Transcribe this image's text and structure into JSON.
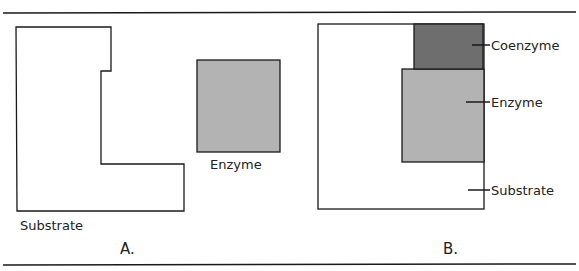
{
  "colors": {
    "line": "#1a1a1a",
    "enzyme_fill": "#b3b3b3",
    "coenzyme_fill": "#6e6e6e",
    "substrate_fill": "#ffffff"
  },
  "panel_a": {
    "caption": "A.",
    "substrate_label": "Substrate",
    "enzyme_label": "Enzyme"
  },
  "panel_b": {
    "caption": "B.",
    "coenzyme_label": "Coenzyme",
    "enzyme_label": "Enzyme",
    "substrate_label": "Substrate"
  }
}
